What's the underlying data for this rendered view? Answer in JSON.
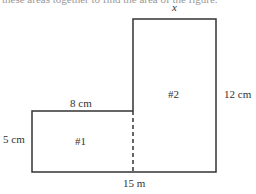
{
  "header_text": "these areas together to find the area of the figure.",
  "figure": {
    "top_label": "x",
    "rect1": {
      "label": "#1",
      "top_width": "8 cm",
      "height": "5 cm"
    },
    "rect2": {
      "label": "#2",
      "height": "12 cm"
    },
    "bottom_total": "15 m"
  }
}
